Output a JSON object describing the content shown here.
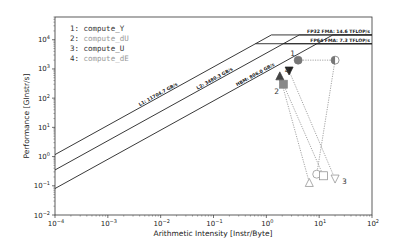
{
  "chart_data": {
    "type": "scatter",
    "title": "",
    "xlabel": "Arithmetic Intensity [Instr/Byte]",
    "ylabel": "Performance [GInstr/s]",
    "xscale": "log",
    "yscale": "log",
    "xlim": [
      0.0001,
      100
    ],
    "ylim": [
      0.01,
      60000
    ],
    "grid": false,
    "x_ticks": [
      "10^-4",
      "10^-3",
      "10^-2",
      "10^-1",
      "10^0",
      "10^1",
      "10^2"
    ],
    "y_ticks": [
      "10^-2",
      "10^-1",
      "10^0",
      "10^1",
      "10^2",
      "10^3",
      "10^4"
    ],
    "x_tick_values": [
      -4,
      -3,
      -2,
      -1,
      0,
      1,
      2
    ],
    "y_tick_values": [
      -2,
      -1,
      0,
      1,
      2,
      3,
      4
    ],
    "rooflines": [
      {
        "name": "L1",
        "label": "L1: 11704.7 GB/s",
        "bandwidth": 11704.7
      },
      {
        "name": "L2",
        "label": "L2: 3480.3 GB/s",
        "bandwidth": 3480.3
      },
      {
        "name": "HBM",
        "label": "HBM: 806.0 GB/s",
        "bandwidth": 806.0
      }
    ],
    "compute_ceilings": [
      {
        "label": "FP32 FMA: 14.6 TFLOP/s",
        "value": 14600
      },
      {
        "label": "FP64 FMA: 7.3 TFLOP/s",
        "value": 7300
      }
    ],
    "legend": [
      {
        "id": "1",
        "label": "compute_Y"
      },
      {
        "id": "2",
        "label": "compute_dU"
      },
      {
        "id": "3",
        "label": "compute_U"
      },
      {
        "id": "4",
        "label": "compute_dE"
      }
    ],
    "legend_position": "upper left",
    "series": [
      {
        "id": "1",
        "name": "compute_Y",
        "marker": "circle",
        "color": "#777777",
        "points": [
          {
            "x": 4.0,
            "y": 2000,
            "level": "HBM"
          },
          {
            "x": 20,
            "y": 2000,
            "level": "L2"
          },
          {
            "x": 9.0,
            "y": 0.25,
            "level": "L1"
          }
        ]
      },
      {
        "id": "2",
        "name": "compute_dU",
        "marker": "square",
        "color": "#888888",
        "points": [
          {
            "x": 2.1,
            "y": 300,
            "level": "HBM"
          },
          {
            "x": 12,
            "y": 0.22,
            "level": "L1"
          }
        ]
      },
      {
        "id": "3",
        "name": "compute_U",
        "marker": "triangle-down",
        "color": "#222222",
        "points": [
          {
            "x": 2.7,
            "y": 850,
            "level": "HBM"
          },
          {
            "x": 20,
            "y": 0.17,
            "level": "L1"
          }
        ]
      },
      {
        "id": "4",
        "name": "compute_dE",
        "marker": "triangle-up",
        "color": "#444444",
        "points": [
          {
            "x": 1.8,
            "y": 580,
            "level": "HBM"
          },
          {
            "x": 6.5,
            "y": 0.13,
            "level": "L1"
          }
        ]
      }
    ]
  }
}
